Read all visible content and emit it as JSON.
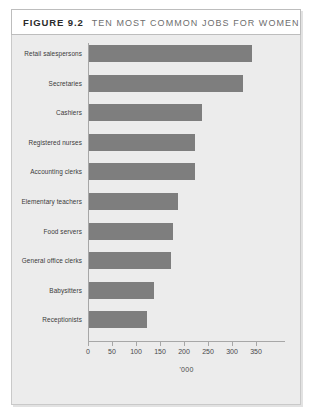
{
  "figure": {
    "number_label": "FIGURE 9.2",
    "title": "TEN MOST COMMON JOBS FOR WOMEN"
  },
  "colors": {
    "bar_fill": "#7e7e7e",
    "panel_background": "#ececec",
    "title_background": "#ffffff",
    "axis_line": "#a7a7a7",
    "frame_border": "#c9c9c9"
  },
  "chart_data": {
    "type": "bar",
    "orientation": "horizontal",
    "title": "TEN MOST COMMON JOBS FOR WOMEN",
    "xlabel": "'000",
    "ylabel": "",
    "xlim": [
      0,
      375
    ],
    "xticks": [
      0,
      50,
      100,
      150,
      200,
      250,
      300,
      350
    ],
    "xticklabels": [
      "0",
      "50",
      "100",
      "150",
      "200",
      "250",
      "300",
      "350"
    ],
    "grid": false,
    "legend": false,
    "categories": [
      "Retail salespersons",
      "Secretaries",
      "Cashiers",
      "Registered nurses",
      "Accounting clerks",
      "Elementary teachers",
      "Food servers",
      "General office clerks",
      "Babysitters",
      "Receptionists"
    ],
    "values": [
      340,
      320,
      235,
      220,
      220,
      185,
      175,
      170,
      135,
      120
    ],
    "units": "thousands"
  }
}
